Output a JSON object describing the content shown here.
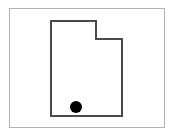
{
  "figure": {
    "title": "Utah",
    "width": 175,
    "height": 136,
    "background_color": "#ffffff"
  },
  "frame": {
    "label": "map border",
    "x": 9,
    "y": 8,
    "width": 156,
    "height": 120,
    "stroke_color": "#b4b4b4",
    "stroke_width": 1,
    "fill_color": "#ffffff"
  },
  "state_outline": {
    "label": "Utah state boundary",
    "stroke_color": "#4a4a4a",
    "stroke_width": 2,
    "fill_color": "#ffffff",
    "points": "51,21 96,21 96,39 122,39 122,116 51,116",
    "vertices": [
      {
        "name": "northwest-corner",
        "x": 51,
        "y": 21
      },
      {
        "name": "north-notch-start",
        "x": 96,
        "y": 21
      },
      {
        "name": "notch-inner-corner",
        "x": 96,
        "y": 39
      },
      {
        "name": "northeast-corner",
        "x": 122,
        "y": 39
      },
      {
        "name": "southeast-corner",
        "x": 122,
        "y": 116
      },
      {
        "name": "southwest-corner",
        "x": 51,
        "y": 116
      }
    ]
  },
  "marker": {
    "label": "location dot",
    "cx": 76,
    "cy": 107,
    "r": 6,
    "fill_color": "#000000"
  }
}
